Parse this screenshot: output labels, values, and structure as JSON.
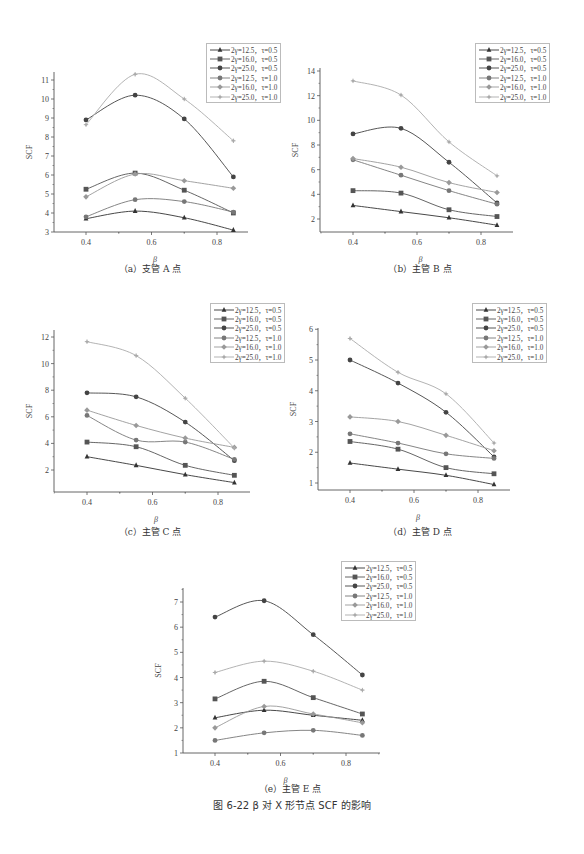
{
  "figure_caption": "图 6-22   β 对 X 形节点 SCF 的影响",
  "legend_labels": [
    "2γ=12.5，τ=0.5",
    "2γ=16.0，τ=0.5",
    "2γ=25.0，τ=0.5",
    "2γ=12.5，τ=1.0",
    "2γ=16.0，τ=1.0",
    "2γ=25.0，τ=1.0"
  ],
  "series_style": [
    {
      "marker": "triangle",
      "color": "#333333"
    },
    {
      "marker": "square",
      "color": "#555555"
    },
    {
      "marker": "circle",
      "color": "#444444"
    },
    {
      "marker": "circle",
      "color": "#777777"
    },
    {
      "marker": "diamond",
      "color": "#999999"
    },
    {
      "marker": "star",
      "color": "#aaaaaa"
    }
  ],
  "chart_data": [
    {
      "type": "line",
      "title": "（a）支管 A 点",
      "xlabel": "β",
      "ylabel": "SCF",
      "x": [
        0.4,
        0.55,
        0.7,
        0.85
      ],
      "xticks": [
        0.4,
        0.6,
        0.8
      ],
      "yticks": [
        3,
        4,
        5,
        6,
        7,
        8,
        9,
        10,
        11
      ],
      "ylim": [
        3,
        11.5
      ],
      "xlim": [
        0.3,
        0.9
      ],
      "series": [
        {
          "name": "2γ=12.5，τ=0.5",
          "values": [
            3.7,
            4.1,
            3.75,
            3.1
          ]
        },
        {
          "name": "2γ=16.0，τ=0.5",
          "values": [
            5.25,
            6.1,
            5.2,
            4.0
          ]
        },
        {
          "name": "2γ=25.0，τ=0.5",
          "values": [
            8.9,
            10.2,
            8.95,
            5.9
          ]
        },
        {
          "name": "2γ=12.5，τ=1.0",
          "values": [
            3.8,
            4.7,
            4.6,
            4.05
          ]
        },
        {
          "name": "2γ=16.0，τ=1.0",
          "values": [
            4.85,
            6.05,
            5.7,
            5.3
          ]
        },
        {
          "name": "2γ=25.0，τ=1.0",
          "values": [
            8.65,
            11.3,
            10.0,
            7.8
          ]
        }
      ],
      "legend_position": "upper right"
    },
    {
      "type": "line",
      "title": "（b）主管 B 点",
      "xlabel": "β",
      "ylabel": "SCF",
      "x": [
        0.4,
        0.55,
        0.7,
        0.85
      ],
      "xticks": [
        0.4,
        0.6,
        0.8
      ],
      "yticks": [
        2,
        4,
        6,
        8,
        10,
        12,
        14
      ],
      "ylim": [
        1,
        14.3
      ],
      "xlim": [
        0.3,
        0.9
      ],
      "series": [
        {
          "name": "2γ=12.5，τ=0.5",
          "values": [
            3.1,
            2.6,
            2.1,
            1.5
          ]
        },
        {
          "name": "2γ=16.0，τ=0.5",
          "values": [
            4.3,
            4.1,
            2.75,
            2.2
          ]
        },
        {
          "name": "2γ=25.0，τ=0.5",
          "values": [
            8.9,
            9.35,
            6.6,
            3.3
          ]
        },
        {
          "name": "2γ=12.5，τ=1.0",
          "values": [
            6.8,
            5.55,
            4.3,
            3.2
          ]
        },
        {
          "name": "2γ=16.0，τ=1.0",
          "values": [
            6.9,
            6.2,
            4.95,
            4.15
          ]
        },
        {
          "name": "2γ=25.0，τ=1.0",
          "values": [
            13.2,
            12.05,
            8.25,
            5.5
          ]
        }
      ],
      "legend_position": "upper right"
    },
    {
      "type": "line",
      "title": "（c）主管 C 点",
      "xlabel": "β",
      "ylabel": "SCF",
      "x": [
        0.4,
        0.55,
        0.7,
        0.85
      ],
      "xticks": [
        0.4,
        0.6,
        0.8
      ],
      "yticks": [
        2,
        4,
        6,
        8,
        10,
        12
      ],
      "ylim": [
        0.8,
        12.2
      ],
      "xlim": [
        0.3,
        0.9
      ],
      "series": [
        {
          "name": "2γ=12.5，τ=0.5",
          "values": [
            3.0,
            2.35,
            1.65,
            1.05
          ]
        },
        {
          "name": "2γ=16.0，τ=0.5",
          "values": [
            4.1,
            3.75,
            2.35,
            1.6
          ]
        },
        {
          "name": "2γ=25.0，τ=0.5",
          "values": [
            7.8,
            7.5,
            5.6,
            2.7
          ]
        },
        {
          "name": "2γ=12.5，τ=1.0",
          "values": [
            6.1,
            4.25,
            4.1,
            2.8
          ]
        },
        {
          "name": "2γ=16.0，τ=1.0",
          "values": [
            6.5,
            5.35,
            4.4,
            3.7
          ]
        },
        {
          "name": "2γ=25.0，τ=1.0",
          "values": [
            11.65,
            10.6,
            7.4,
            3.65
          ]
        }
      ],
      "legend_position": "upper right"
    },
    {
      "type": "line",
      "title": "（d）主管 D 点",
      "xlabel": "β",
      "ylabel": "SCF",
      "x": [
        0.4,
        0.55,
        0.7,
        0.85
      ],
      "xticks": [
        0.4,
        0.6,
        0.8
      ],
      "yticks": [
        1,
        2,
        3,
        4,
        5,
        6
      ],
      "ylim": [
        0.75,
        6.0
      ],
      "xlim": [
        0.3,
        0.9
      ],
      "series": [
        {
          "name": "2γ=12.5，τ=0.5",
          "values": [
            1.65,
            1.45,
            1.25,
            0.95
          ]
        },
        {
          "name": "2γ=16.0，τ=0.5",
          "values": [
            2.35,
            2.1,
            1.5,
            1.3
          ]
        },
        {
          "name": "2γ=25.0，τ=0.5",
          "values": [
            5.0,
            4.25,
            3.3,
            1.85
          ]
        },
        {
          "name": "2γ=12.5，τ=1.0",
          "values": [
            2.6,
            2.3,
            1.95,
            1.8
          ]
        },
        {
          "name": "2γ=16.0，τ=1.0",
          "values": [
            3.15,
            3.0,
            2.55,
            2.05
          ]
        },
        {
          "name": "2γ=25.0，τ=1.0",
          "values": [
            5.7,
            4.6,
            3.9,
            2.3
          ]
        }
      ],
      "legend_position": "upper right"
    },
    {
      "type": "line",
      "title": "（e）主管 E 点",
      "xlabel": "β",
      "ylabel": "SCF",
      "x": [
        0.4,
        0.55,
        0.7,
        0.85
      ],
      "xticks": [
        0.4,
        0.6,
        0.8
      ],
      "yticks": [
        1,
        2,
        3,
        4,
        5,
        6,
        7
      ],
      "ylim": [
        1,
        7.5
      ],
      "xlim": [
        0.3,
        0.9
      ],
      "series": [
        {
          "name": "2γ=12.5，τ=0.5",
          "values": [
            2.4,
            2.7,
            2.5,
            2.3
          ]
        },
        {
          "name": "2γ=16.0，τ=0.5",
          "values": [
            3.15,
            3.85,
            3.2,
            2.55
          ]
        },
        {
          "name": "2γ=25.0，τ=0.5",
          "values": [
            6.4,
            7.05,
            5.7,
            4.1
          ]
        },
        {
          "name": "2γ=12.5，τ=1.0",
          "values": [
            1.5,
            1.8,
            1.9,
            1.7
          ]
        },
        {
          "name": "2γ=16.0，τ=1.0",
          "values": [
            2.0,
            2.85,
            2.55,
            2.2
          ]
        },
        {
          "name": "2γ=25.0，τ=1.0",
          "values": [
            4.2,
            4.65,
            4.25,
            3.5
          ]
        }
      ],
      "legend_position": "upper right"
    }
  ]
}
